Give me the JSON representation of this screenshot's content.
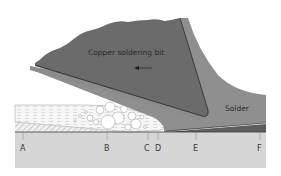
{
  "diagram": {
    "title_label": "Copper soldering bit",
    "solder_label": "Solder",
    "direction_arrow": "arrow-left",
    "points": [
      {
        "id": "A",
        "label": "A",
        "x": 23
      },
      {
        "id": "B",
        "label": "B",
        "x": 107
      },
      {
        "id": "C",
        "label": "C",
        "x": 148
      },
      {
        "id": "D",
        "label": "D",
        "x": 158
      },
      {
        "id": "E",
        "label": "E",
        "x": 196
      },
      {
        "id": "F",
        "label": "F",
        "x": 260
      }
    ],
    "colors": {
      "bit": "#6b6b6b",
      "solder": "#8f8f8f",
      "solidified_solder": "#5e5e5e",
      "base_metal": "#d6d6d6",
      "flux": "#f4f4f4",
      "oxide_hatch": "#bdbdbd",
      "outline": "#2e2e2e"
    }
  }
}
